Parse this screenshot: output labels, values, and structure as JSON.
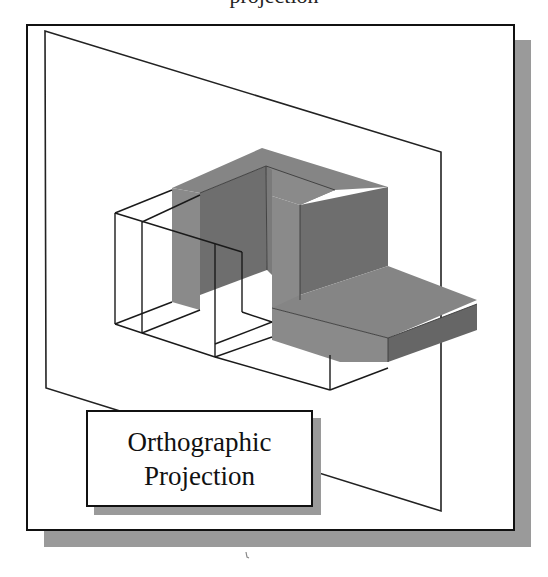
{
  "figure": {
    "top_caption_cropped": "projection",
    "label": {
      "line1": "Orthographic",
      "line2": "Projection"
    }
  },
  "colors": {
    "frame_border": "#111111",
    "frame_shadow": "#9a9a9a",
    "plane_stroke": "#222222",
    "face_top": "#858585",
    "face_left": "#8a8a8a",
    "face_right": "#6e6e6e",
    "face_dark": "#666666",
    "wire_stroke": "#1a1a1a"
  }
}
